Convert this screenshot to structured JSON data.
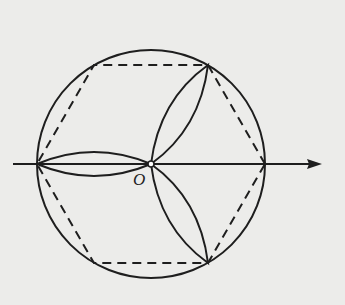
{
  "figure": {
    "origin_label": "O",
    "colors": {
      "background": "#ececea",
      "stroke": "#1e1e1e"
    },
    "geometry": {
      "center": [
        151,
        164
      ],
      "radius": 114,
      "hexagon_vertices": [
        [
          265,
          164
        ],
        [
          208,
          65
        ],
        [
          94,
          65
        ],
        [
          37,
          164
        ],
        [
          94,
          263
        ],
        [
          208,
          263
        ]
      ],
      "petal_tips": [
        [
          37,
          164
        ],
        [
          208,
          65
        ],
        [
          208,
          263
        ]
      ],
      "axis": {
        "from": [
          13,
          164
        ],
        "to": [
          322,
          164
        ],
        "arrow": true
      }
    },
    "elements": [
      "circumscribed circle",
      "dashed regular hexagon",
      "three-petal rose curve",
      "polar axis with arrow",
      "origin point O"
    ]
  }
}
